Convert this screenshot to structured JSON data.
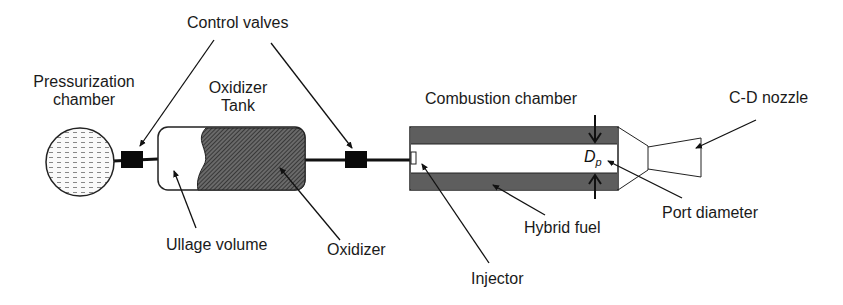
{
  "labels": {
    "pressurization_chamber": [
      "Pressurization",
      "chamber"
    ],
    "control_valves": "Control valves",
    "oxidizer_tank": [
      "Oxidizer",
      "Tank"
    ],
    "ullage_volume": "Ullage volume",
    "oxidizer": "Oxidizer",
    "combustion_chamber": "Combustion chamber",
    "cd_nozzle": "C-D nozzle",
    "port_diameter": "Port diameter",
    "hybrid_fuel": "Hybrid fuel",
    "injector": "Injector",
    "dp_symbol": "D",
    "dp_subscript": "p"
  },
  "colors": {
    "stroke": "#111111",
    "fuel_grain": "#5a5a5a",
    "oxidizer_hatch": "#3a3a3a",
    "valve": "#0a0a0a"
  }
}
